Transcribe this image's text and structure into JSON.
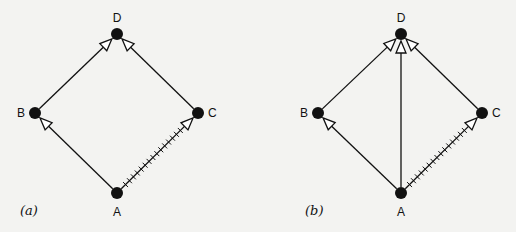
{
  "colors": {
    "background": "#f3f3f1",
    "ink": "#111111",
    "arrowhead_fill": "#ffffff"
  },
  "panels": [
    {
      "id": "a",
      "label": "(a)",
      "label_pos": [
        20,
        215
      ],
      "nodes": [
        {
          "id": "D",
          "label": "D",
          "x": 117,
          "y": 34,
          "label_dx": 0,
          "label_dy": -12,
          "anchor": "middle"
        },
        {
          "id": "B",
          "label": "B",
          "x": 35,
          "y": 113,
          "label_dx": -10,
          "label_dy": 4,
          "anchor": "end"
        },
        {
          "id": "C",
          "label": "C",
          "x": 198,
          "y": 113,
          "label_dx": 10,
          "label_dy": 4,
          "anchor": "start"
        },
        {
          "id": "A",
          "label": "A",
          "x": 117,
          "y": 193,
          "label_dx": 0,
          "label_dy": 23,
          "anchor": "middle"
        }
      ],
      "edges": [
        {
          "from": "A",
          "to": "B",
          "style": "solid"
        },
        {
          "from": "A",
          "to": "C",
          "style": "hatched"
        },
        {
          "from": "B",
          "to": "D",
          "style": "solid"
        },
        {
          "from": "C",
          "to": "D",
          "style": "solid"
        }
      ]
    },
    {
      "id": "b",
      "label": "(b)",
      "label_pos": [
        305,
        215
      ],
      "nodes": [
        {
          "id": "D",
          "label": "D",
          "x": 401,
          "y": 34,
          "label_dx": 0,
          "label_dy": -12,
          "anchor": "middle"
        },
        {
          "id": "B",
          "label": "B",
          "x": 318,
          "y": 113,
          "label_dx": -10,
          "label_dy": 4,
          "anchor": "end"
        },
        {
          "id": "C",
          "label": "C",
          "x": 482,
          "y": 113,
          "label_dx": 10,
          "label_dy": 4,
          "anchor": "start"
        },
        {
          "id": "A",
          "label": "A",
          "x": 401,
          "y": 193,
          "label_dx": 0,
          "label_dy": 23,
          "anchor": "middle"
        }
      ],
      "edges": [
        {
          "from": "A",
          "to": "B",
          "style": "solid"
        },
        {
          "from": "A",
          "to": "C",
          "style": "hatched"
        },
        {
          "from": "B",
          "to": "D",
          "style": "solid"
        },
        {
          "from": "C",
          "to": "D",
          "style": "solid"
        },
        {
          "from": "A",
          "to": "D",
          "style": "solid"
        }
      ]
    }
  ]
}
